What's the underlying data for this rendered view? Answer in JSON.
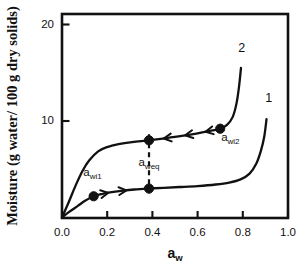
{
  "chart_data": {
    "type": "line",
    "title": "",
    "xlabel": "a_w",
    "xlabel_base": "a",
    "xlabel_sub": "w",
    "ylabel": "Moisture (g water/ 100 g dry solids)",
    "xlim": [
      0.0,
      1.0
    ],
    "ylim": [
      0,
      22
    ],
    "grid": false,
    "legend": "none",
    "xticks": [
      "0.0",
      "0.2",
      "0.4",
      "0.6",
      "0.8",
      "1.0"
    ],
    "xtick_values": [
      0.0,
      0.2,
      0.4,
      0.6,
      0.8,
      1.0
    ],
    "yticks": [
      "10",
      "20"
    ],
    "ytick_values": [
      10,
      20
    ],
    "series": [
      {
        "name": "1",
        "label": "1",
        "description": "adsorption isotherm (lower curve)",
        "x": [
          0.0,
          0.03,
          0.07,
          0.1,
          0.14,
          0.18,
          0.22,
          0.27,
          0.32,
          0.385,
          0.45,
          0.52,
          0.6,
          0.68,
          0.74,
          0.79,
          0.83,
          0.86,
          0.88,
          0.895,
          0.905
        ],
        "y": [
          0.0,
          0.55,
          1.2,
          1.7,
          2.2,
          2.45,
          2.62,
          2.78,
          2.9,
          3.0,
          3.08,
          3.16,
          3.26,
          3.42,
          3.62,
          3.95,
          4.55,
          5.6,
          6.9,
          8.4,
          10.2
        ]
      },
      {
        "name": "2",
        "label": "2",
        "description": "desorption isotherm (upper curve)",
        "x": [
          0.0,
          0.03,
          0.06,
          0.09,
          0.12,
          0.16,
          0.2,
          0.25,
          0.31,
          0.385,
          0.46,
          0.53,
          0.6,
          0.66,
          0.7,
          0.73,
          0.755,
          0.772,
          0.783,
          0.792
        ],
        "y": [
          0.0,
          1.6,
          3.3,
          4.8,
          5.9,
          6.85,
          7.3,
          7.6,
          7.82,
          8.0,
          8.22,
          8.45,
          8.72,
          9.0,
          9.2,
          9.6,
          10.4,
          11.8,
          13.5,
          15.5
        ]
      }
    ],
    "annotations": [
      {
        "id": "a_wi1",
        "base": "a",
        "sub": "wi1",
        "x": 0.14,
        "y": 2.2,
        "label_x": 0.135,
        "label_y": 4.35,
        "marker": true
      },
      {
        "id": "a_weq",
        "base": "a",
        "sub": "weq",
        "x": 0.385,
        "y_upper": 8.0,
        "y_lower": 3.0,
        "label_x": 0.385,
        "label_y": 5.35,
        "marker": true,
        "dashed_vertical": true
      },
      {
        "id": "a_wi2",
        "base": "a",
        "sub": "wi2",
        "x": 0.7,
        "y": 9.2,
        "label_x": 0.745,
        "label_y": 7.9,
        "marker": true
      }
    ],
    "curve_labels": [
      {
        "text": "2",
        "x": 0.795,
        "y": 17.2
      },
      {
        "text": "1",
        "x": 0.915,
        "y": 12.0
      }
    ],
    "direction_arrows": [
      {
        "series": "2",
        "x": 0.45,
        "direction": "left"
      },
      {
        "series": "2",
        "x": 0.545,
        "direction": "left"
      },
      {
        "series": "2",
        "x": 0.635,
        "direction": "left"
      },
      {
        "series": "1",
        "x": 0.205,
        "direction": "right"
      },
      {
        "series": "1",
        "x": 0.285,
        "direction": "right"
      }
    ]
  },
  "colors": {
    "axis": "#111111",
    "curve": "#111111",
    "marker": "#111111",
    "background": "#ffffff"
  }
}
